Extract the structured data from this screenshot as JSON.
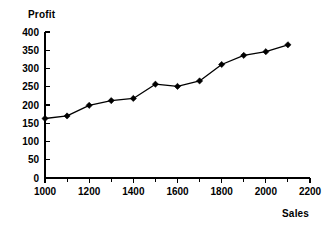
{
  "chart_data": {
    "type": "line",
    "title": "",
    "xlabel": "Sales",
    "ylabel": "Profit",
    "x": [
      1000,
      1100,
      1200,
      1300,
      1400,
      1500,
      1600,
      1700,
      1800,
      1900,
      2000,
      2100
    ],
    "values": [
      163,
      170,
      199,
      212,
      218,
      257,
      251,
      266,
      311,
      336,
      346,
      365
    ],
    "series": [
      {
        "name": "Profit",
        "values": [
          163,
          170,
          199,
          212,
          218,
          257,
          251,
          266,
          311,
          336,
          346,
          365
        ]
      }
    ],
    "xlim": [
      1000,
      2200
    ],
    "ylim": [
      0,
      400
    ],
    "xticks": [
      1000,
      1200,
      1400,
      1600,
      1800,
      2000,
      2200
    ],
    "xticklabels": [
      "1000",
      "1200",
      "1400",
      "1600",
      "1800",
      "2000",
      "2200"
    ],
    "xminor_ticks": [
      1100,
      1300,
      1500,
      1700,
      1900,
      2100
    ],
    "yticks": [
      0,
      50,
      100,
      150,
      200,
      250,
      300,
      350,
      400
    ],
    "yticklabels": [
      "0",
      "50",
      "100",
      "150",
      "200",
      "250",
      "300",
      "350",
      "400"
    ],
    "grid": false,
    "legend": false,
    "marker": "diamond",
    "line_color": "#000000",
    "marker_color": "#000000",
    "background_color": "#ffffff"
  }
}
